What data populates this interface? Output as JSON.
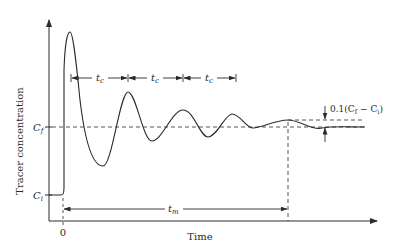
{
  "diagram": {
    "y_axis_label": "Tracer concentration",
    "x_axis_label": "Time",
    "x_origin_label": "0",
    "level_final_label_main": "C",
    "level_final_label_sub": "f",
    "level_initial_label_main": "C",
    "level_initial_label_sub": "i",
    "period_label_main": "t",
    "period_label_sub": "c",
    "mixing_time_label_main": "t",
    "mixing_time_label_sub": "m",
    "tolerance_label": "0.1(C",
    "tolerance_label_sub1": "f",
    "tolerance_label_mid": " − C",
    "tolerance_label_sub2": "i",
    "tolerance_label_end": ")",
    "colors": {
      "ink": "#2a2a2a",
      "background": "#ffffff"
    }
  }
}
